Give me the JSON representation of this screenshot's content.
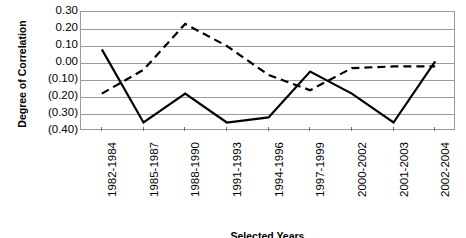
{
  "chart_data": {
    "type": "line",
    "title": "",
    "xlabel": "Selected Years",
    "ylabel": "Degree of Correlation",
    "categories": [
      "1982-1984",
      "1985-1987",
      "1988-1990",
      "1991-1993",
      "1994-1996",
      "1997-1999",
      "2000-2002",
      "2001-2003",
      "2002-2004"
    ],
    "ytick_labels": [
      "0.30",
      "0.20",
      "0.10",
      "0.00",
      "(0.10)",
      "(0.20)",
      "(0.30)",
      "(0.40)"
    ],
    "ytick_values": [
      0.3,
      0.2,
      0.1,
      0.0,
      -0.1,
      -0.2,
      -0.3,
      -0.4
    ],
    "ylim": [
      -0.4,
      0.3
    ],
    "grid": true,
    "legend": "none",
    "series": [
      {
        "name": "solid-series",
        "style": "solid",
        "color": "#000000",
        "values": [
          0.08,
          -0.35,
          -0.18,
          -0.35,
          -0.32,
          -0.05,
          -0.18,
          -0.35,
          0.01
        ]
      },
      {
        "name": "dashed-series",
        "style": "dashed",
        "color": "#000000",
        "values": [
          -0.18,
          -0.04,
          0.23,
          0.1,
          -0.07,
          -0.16,
          -0.03,
          -0.02,
          -0.02
        ]
      }
    ]
  },
  "axis": {
    "y_title": "Degree of Correlation",
    "x_title": "Selected Years"
  },
  "colors": {
    "grid": "#9a9a9a",
    "axis_line": "#9a9a9a",
    "series_line": "#000000",
    "text": "#000000",
    "background": "#ffffff"
  }
}
